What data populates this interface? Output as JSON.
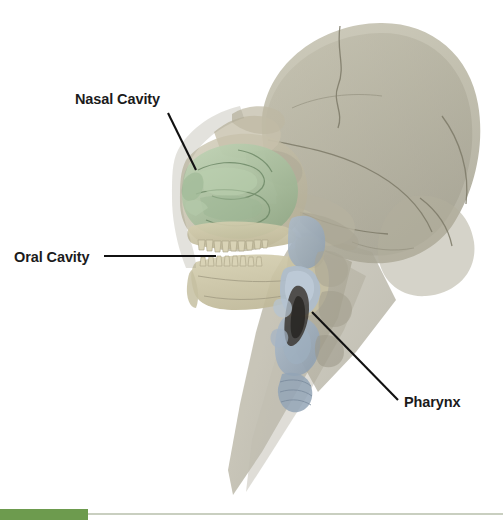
{
  "figure": {
    "type": "anatomical-illustration",
    "background_color": "#ffffff",
    "width": 503,
    "height": 520
  },
  "labels": [
    {
      "id": "nasal-cavity",
      "text": "Nasal Cavity",
      "text_x": 75,
      "text_y": 104,
      "leader": {
        "x1": 168,
        "y1": 113,
        "x2": 196,
        "y2": 170
      },
      "anchor": "start",
      "region_color": "#a9c0a0"
    },
    {
      "id": "oral-cavity",
      "text": "Oral Cavity",
      "text_x": 14,
      "text_y": 262,
      "leader": {
        "x1": 104,
        "y1": 256,
        "x2": 216,
        "y2": 256
      },
      "anchor": "start",
      "region_color": "#cfc9a8"
    },
    {
      "id": "pharynx",
      "text": "Pharynx",
      "text_x": 404,
      "text_y": 407,
      "leader": {
        "x1": 312,
        "y1": 312,
        "x2": 398,
        "y2": 400
      },
      "anchor": "start",
      "region_color": "#9aabbd"
    }
  ],
  "structures": {
    "cranium": {
      "name": "cranium",
      "color": "#b7b4a1"
    },
    "facial_bones": {
      "name": "facial-bones",
      "color": "#c3bda6"
    },
    "nasal_cavity": {
      "name": "nasal-cavity",
      "color": "#a9c0a0"
    },
    "mandible": {
      "name": "mandible",
      "color": "#cdc7a6"
    },
    "teeth": {
      "name": "teeth",
      "color": "#d8d2b4"
    },
    "pharynx": {
      "name": "pharynx",
      "color": "#9aabbd"
    },
    "larynx": {
      "name": "larynx",
      "color": "#8b9cae"
    },
    "airway_shadow": {
      "name": "airway-lumen",
      "color": "#3a3630"
    },
    "neck_soft_tissue": {
      "name": "neck-soft-tissue",
      "color": "#b3af9c"
    }
  },
  "footer": {
    "accent_color": "#6d9b4e",
    "rule_color": "#c9cfc0"
  },
  "text_color": "#1b1b1b"
}
